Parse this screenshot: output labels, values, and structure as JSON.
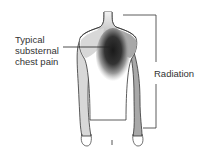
{
  "labels": {
    "pain": "Typical substernal chest pain",
    "radiation": "Radiation"
  },
  "colors": {
    "outline": "#333333",
    "light_gray": "#d8d8d8",
    "mid_gray": "#a9a9a9",
    "dark_core": "#1f1f1f"
  }
}
